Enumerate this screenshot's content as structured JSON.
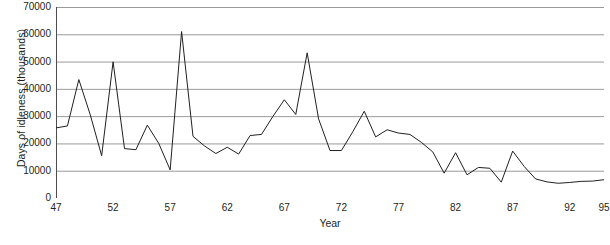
{
  "chart_data": {
    "type": "line",
    "title": "",
    "xlabel": "Year",
    "ylabel": "Days of idleness (thousands)",
    "xlim": [
      47,
      95
    ],
    "ylim": [
      0,
      70000
    ],
    "grid": true,
    "legend": false,
    "legend_position": "none",
    "y_ticks": [
      70000,
      60000,
      50000,
      40000,
      30000,
      20000,
      10000,
      0
    ],
    "y_tick_labels": [
      "70000",
      "60000",
      "50000",
      "40000",
      "30000",
      "20000",
      "10000",
      "0"
    ],
    "x_ticks": [
      47,
      52,
      57,
      62,
      67,
      72,
      77,
      82,
      87,
      92,
      95
    ],
    "x_tick_labels": [
      "47",
      "52",
      "57",
      "62",
      "67",
      "72",
      "77",
      "82",
      "87",
      "92",
      "95"
    ],
    "x_minor_tick_step": 1,
    "line_color": "#231f20",
    "grid_color": "#9a9a9a",
    "x": [
      47,
      48,
      49,
      50,
      51,
      52,
      53,
      54,
      55,
      56,
      57,
      58,
      59,
      60,
      61,
      62,
      63,
      64,
      65,
      66,
      67,
      68,
      69,
      70,
      71,
      72,
      73,
      74,
      75,
      76,
      77,
      78,
      79,
      80,
      81,
      82,
      83,
      84,
      85,
      86,
      87,
      88,
      89,
      90,
      91,
      92,
      93,
      94,
      95
    ],
    "values": [
      25700,
      26400,
      43400,
      30500,
      15500,
      49900,
      18100,
      17700,
      26700,
      20000,
      10300,
      61000,
      22600,
      19100,
      16300,
      18600,
      16100,
      22900,
      23300,
      29900,
      36000,
      30600,
      53200,
      29000,
      17400,
      17400,
      24300,
      31800,
      22400,
      25000,
      23800,
      23300,
      20400,
      16900,
      9100,
      16600,
      8500,
      11200,
      10900,
      5800,
      17200,
      11600,
      7000,
      5900,
      5400,
      5700,
      6100,
      6200,
      6700
    ],
    "series_name": "Days of idleness"
  },
  "axes": {
    "y_title": "Days of idleness (thousands)",
    "x_title": "Year"
  }
}
